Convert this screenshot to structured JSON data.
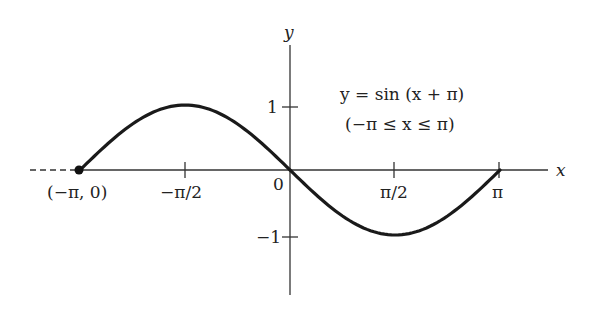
{
  "chart_data": {
    "type": "line",
    "title": "y = sin (x + π)",
    "subtitle": "(−π ≤ x ≤ π)",
    "xlabel": "x",
    "ylabel": "y",
    "x_ticks": [
      {
        "value": -3.14159,
        "label": "(−π, 0)"
      },
      {
        "value": -1.5708,
        "label": "−π/2"
      },
      {
        "value": 0,
        "label": "0"
      },
      {
        "value": 1.5708,
        "label": "π/2"
      },
      {
        "value": 3.14159,
        "label": "π"
      }
    ],
    "y_ticks": [
      {
        "value": 1,
        "label": "1"
      },
      {
        "value": -1,
        "label": "−1"
      }
    ],
    "xlim": [
      -3.6,
      3.9
    ],
    "ylim": [
      -1.9,
      1.9
    ],
    "grid": false,
    "legend": null,
    "series": [
      {
        "name": "y = sin(x + π)",
        "x": [
          -3.14159,
          -2.35619,
          -1.5708,
          -0.7854,
          0,
          0.7854,
          1.5708,
          2.35619,
          3.14159
        ],
        "values": [
          0,
          0.7071,
          1,
          0.7071,
          0,
          -0.7071,
          -1,
          -0.7071,
          0
        ]
      }
    ],
    "annotations": [
      {
        "type": "point",
        "x": -3.14159,
        "y": 0,
        "label": "(−π, 0)"
      }
    ]
  },
  "labels": {
    "y_axis": "y",
    "x_axis": "x",
    "equation": "y = sin (x + π)",
    "domain": "(−π ≤ x ≤ π)",
    "tick_neg_pi": "(−π, 0)",
    "tick_neg_half_pi": "−π/2",
    "tick_zero": "0",
    "tick_half_pi": "π/2",
    "tick_pi": "π",
    "tick_y_one": "1",
    "tick_y_neg_one": "−1"
  }
}
